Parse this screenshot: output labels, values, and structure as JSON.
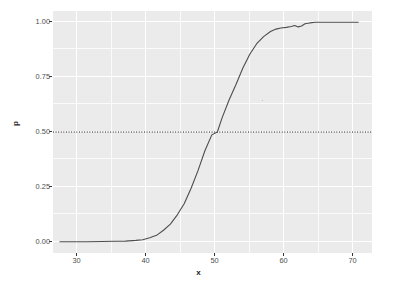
{
  "chart_data": {
    "type": "line",
    "title": "",
    "xlabel": "x",
    "ylabel": "p",
    "xlim": [
      27.0,
      73.2
    ],
    "ylim": [
      -0.048,
      1.048
    ],
    "x_ticks": [
      30,
      40,
      50,
      60,
      70
    ],
    "x_tick_labels": [
      "30",
      "40",
      "50",
      "60",
      "70"
    ],
    "y_ticks": [
      0.0,
      0.25,
      0.5,
      0.75,
      1.0
    ],
    "y_tick_labels": [
      "0.00",
      "0.25",
      "0.50",
      "0.75",
      "1.00"
    ],
    "grid": true,
    "grid_major_color": "#ffffff",
    "grid_minor_color": "#ffffff",
    "panel_background": "#ebebeb",
    "legend": null,
    "legend_position": "none",
    "annotations": [
      {
        "type": "hline",
        "y": 0.5,
        "linestyle": "dotted",
        "color": "#000000",
        "label": ""
      }
    ],
    "series": [
      {
        "name": "p",
        "color": "#4d4d4d",
        "linewidth": 1.1,
        "x": [
          28.0,
          30.0,
          32.0,
          34.0,
          36.0,
          37.5,
          39.0,
          40.0,
          41.0,
          42.0,
          43.0,
          44.0,
          45.0,
          46.0,
          47.0,
          48.0,
          49.0,
          50.0,
          50.8,
          51.5,
          52.5,
          53.5,
          54.5,
          55.5,
          56.5,
          57.5,
          58.5,
          59.3,
          60.0,
          60.8,
          61.5,
          62.0,
          62.5,
          63.0,
          63.5,
          64.2,
          65.0,
          66.0,
          68.0,
          70.0,
          71.2
        ],
        "y": [
          0.003,
          0.003,
          0.003,
          0.004,
          0.005,
          0.006,
          0.009,
          0.012,
          0.021,
          0.032,
          0.055,
          0.083,
          0.125,
          0.175,
          0.245,
          0.325,
          0.415,
          0.487,
          0.5,
          0.565,
          0.645,
          0.715,
          0.79,
          0.852,
          0.9,
          0.932,
          0.955,
          0.966,
          0.971,
          0.974,
          0.978,
          0.982,
          0.976,
          0.98,
          0.99,
          0.994,
          0.997,
          0.997,
          0.997,
          0.997,
          0.997
        ]
      }
    ]
  },
  "axis": {
    "y_title": "p",
    "x_title": "x"
  }
}
